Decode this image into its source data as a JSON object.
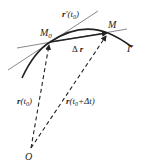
{
  "diagram": {
    "labels": {
      "tangent": "r'(t0)",
      "tangent_r": "r",
      "tangent_arg": "'(t",
      "tangent_sub": "0",
      "tangent_close": ")",
      "M0": "M",
      "M0_sub": "0",
      "M": "M",
      "gamma": "Γ",
      "delta_r_prefix": "Δ",
      "delta_r_vec": "r",
      "r_t0_vec": "r",
      "r_t0_arg": "(t",
      "r_t0_sub": "0",
      "r_t0_close": ")",
      "r_t0dt_vec": "r",
      "r_t0dt_arg": "(t",
      "r_t0dt_sub": "0",
      "r_t0dt_rest": "+Δt)",
      "origin": "O"
    },
    "points": {
      "O": [
        31,
        148
      ],
      "M0": [
        50,
        42
      ],
      "M": [
        108,
        33
      ]
    },
    "colors": {
      "stroke": "#222222",
      "thin_line": "#555555"
    }
  }
}
